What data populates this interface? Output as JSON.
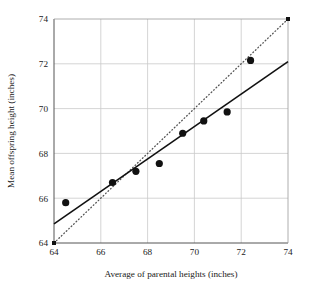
{
  "chart_data": {
    "type": "scatter",
    "title": "",
    "xlabel": "Average of parental heights (inches)",
    "ylabel": "Mean offspring height (inches)",
    "xlim": [
      64,
      74
    ],
    "ylim": [
      64,
      74
    ],
    "xticks": [
      64,
      66,
      68,
      70,
      72,
      74
    ],
    "yticks": [
      64,
      66,
      68,
      70,
      72,
      74
    ],
    "xtick_labels": [
      "64",
      "66",
      "68",
      "70",
      "72",
      "74"
    ],
    "ytick_labels": [
      "64",
      "66",
      "68",
      "70",
      "72",
      "74"
    ],
    "grid": true,
    "legend": "none",
    "points": [
      {
        "x": 64.5,
        "y": 65.8
      },
      {
        "x": 66.5,
        "y": 66.7
      },
      {
        "x": 67.5,
        "y": 67.2
      },
      {
        "x": 68.5,
        "y": 67.55
      },
      {
        "x": 69.5,
        "y": 68.9
      },
      {
        "x": 70.4,
        "y": 69.45
      },
      {
        "x": 71.4,
        "y": 69.85
      },
      {
        "x": 72.4,
        "y": 72.15
      }
    ],
    "series": [
      {
        "name": "regression-line",
        "style": "solid",
        "x": [
          64,
          74
        ],
        "values": [
          64.85,
          72.1
        ]
      },
      {
        "name": "identity-line",
        "style": "dotted",
        "x": [
          64,
          74
        ],
        "values": [
          64,
          74
        ]
      }
    ],
    "endpoint_markers": [
      {
        "x": 64,
        "y": 64
      },
      {
        "x": 74,
        "y": 74
      }
    ],
    "colors": {
      "point": "#111111",
      "regression_line": "#111111",
      "identity_line": "#555555",
      "grid": "#c9c9c9",
      "axis": "#555555",
      "background": "#ffffff"
    }
  }
}
